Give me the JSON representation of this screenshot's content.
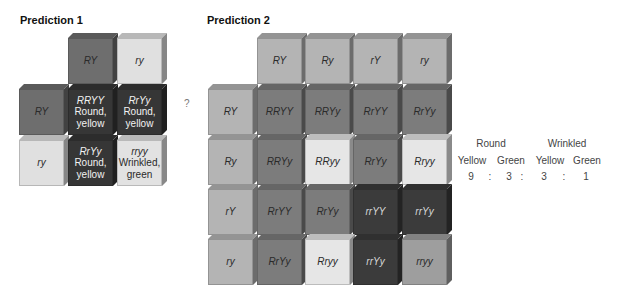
{
  "colors": {
    "p1_parent_dominant": "#6e6e6e",
    "p1_parent_recessive": "#e0e0e0",
    "p1_round_yellow": "#363636",
    "p1_wrinkled_green": "#e2e2e2",
    "p2_gamete": "#b4b4b4",
    "p2_round_yellow": "#7c7c7c",
    "p2_round_green": "#e6e6e6",
    "p2_wrinkled_yellow": "#3b3b3b",
    "p2_wrinkled_green": "#9e9e9e"
  },
  "prediction1": {
    "title": "Prediction 1",
    "col_headers": [
      "RY",
      "ry"
    ],
    "row_headers": [
      "RY",
      "ry"
    ],
    "cells": [
      [
        {
          "genotype": "RRYY",
          "phenotype": [
            "Round,",
            "yellow"
          ]
        },
        {
          "genotype": "RrYy",
          "phenotype": [
            "Round,",
            "yellow"
          ]
        }
      ],
      [
        {
          "genotype": "RrYy",
          "phenotype": [
            "Round,",
            "yellow"
          ]
        },
        {
          "genotype": "rryy",
          "phenotype": [
            "Wrinkled,",
            "green"
          ]
        }
      ]
    ]
  },
  "question_mark": "?",
  "prediction2": {
    "title": "Prediction 2",
    "col_headers": [
      "RY",
      "Ry",
      "rY",
      "ry"
    ],
    "row_headers": [
      "RY",
      "Ry",
      "rY",
      "ry"
    ],
    "cells": [
      [
        "RRYY",
        "RRYy",
        "RrYY",
        "RrYy"
      ],
      [
        "RRYy",
        "RRyy",
        "RrYy",
        "Rryy"
      ],
      [
        "RrYY",
        "RrYy",
        "rrYY",
        "rrYy"
      ],
      [
        "RrYy",
        "Rryy",
        "rrYy",
        "rryy"
      ]
    ]
  },
  "ratio": {
    "groups": [
      "Round",
      "Wrinkled"
    ],
    "subgroups": [
      "Yellow",
      "Green",
      "Yellow",
      "Green"
    ],
    "values": [
      "9",
      "3",
      "3",
      "1"
    ],
    "separator": ":"
  }
}
